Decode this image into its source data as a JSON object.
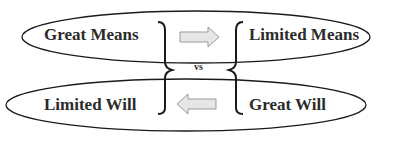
{
  "diagram": {
    "top": {
      "left_label": "Great Means",
      "right_label": "Limited Means",
      "arrow_direction": "right"
    },
    "bottom": {
      "left_label": "Limited Will",
      "right_label": "Great Will",
      "arrow_direction": "left"
    },
    "center_label": "vs",
    "colors": {
      "stroke": "#1a1a1a",
      "arrow_fill": "#e6e6e6",
      "arrow_stroke": "#9a9a9a",
      "text": "#2b2b2b"
    }
  }
}
